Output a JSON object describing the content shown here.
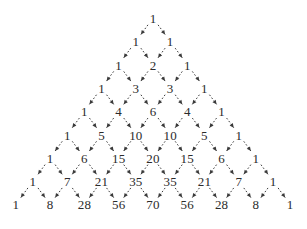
{
  "figure": {
    "background_color": "#ffffff",
    "text_color": "#2b2b2b",
    "arrow_color": "#3a3a3a"
  },
  "chart_data": {
    "type": "diagram",
    "subtitle": "",
    "xlabel": "",
    "ylabel": "",
    "grid": false,
    "legend": null,
    "rows": [
      {
        "index": 0,
        "values": [
          1
        ]
      },
      {
        "index": 1,
        "values": [
          1,
          1
        ]
      },
      {
        "index": 2,
        "values": [
          1,
          2,
          1
        ]
      },
      {
        "index": 3,
        "values": [
          1,
          3,
          3,
          1
        ]
      },
      {
        "index": 4,
        "values": [
          1,
          4,
          6,
          4,
          1
        ]
      },
      {
        "index": 5,
        "values": [
          1,
          5,
          10,
          10,
          5,
          1
        ]
      },
      {
        "index": 6,
        "values": [
          1,
          6,
          15,
          20,
          15,
          6,
          1
        ]
      },
      {
        "index": 7,
        "values": [
          1,
          7,
          21,
          35,
          35,
          21,
          7,
          1
        ]
      },
      {
        "index": 8,
        "values": [
          1,
          8,
          28,
          56,
          70,
          56,
          28,
          8,
          1
        ]
      }
    ],
    "row_count": 9,
    "edges_description": "each entry has two dashed arrows pointing down-left and down-right to the two entries it contributes to in the next row",
    "layout": {
      "top_y": 18,
      "row_spacing": 23.3,
      "column_spacing": 34.3,
      "center_x": 153
    }
  }
}
